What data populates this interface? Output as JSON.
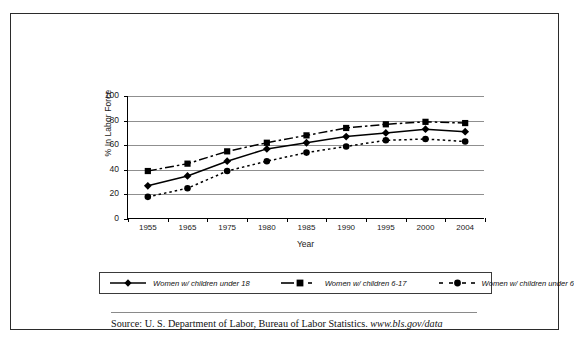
{
  "document": {
    "source_prefix": "Source:  U. S. Department of Labor, Bureau of Labor Statistics.",
    "source_url": "www.bls.gov/data"
  },
  "chart_data": {
    "type": "line",
    "title": "",
    "xlabel": "Year",
    "ylabel": "% In Labor Force",
    "categories": [
      "1955",
      "1965",
      "1975",
      "1980",
      "1985",
      "1990",
      "1995",
      "2000",
      "2004"
    ],
    "ylim": [
      0,
      100
    ],
    "yticks": [
      "0",
      "20",
      "40",
      "60",
      "80",
      "100"
    ],
    "grid": true,
    "legend_position": "bottom",
    "series": [
      {
        "name": "Women w/ children under 18",
        "marker": "diamond",
        "line_style": "solid",
        "color": "#000000",
        "values": [
          27,
          35,
          47,
          57,
          62,
          67,
          70,
          73,
          71
        ]
      },
      {
        "name": "Women w/ children 6-17",
        "marker": "square",
        "line_style": "dash-dot",
        "color": "#000000",
        "values": [
          39,
          45,
          55,
          62,
          68,
          74,
          77,
          79,
          78
        ]
      },
      {
        "name": "Women w/ children under 6",
        "marker": "circle",
        "line_style": "dotted",
        "color": "#000000",
        "values": [
          18,
          25,
          39,
          47,
          54,
          59,
          64,
          65,
          63
        ]
      }
    ]
  }
}
